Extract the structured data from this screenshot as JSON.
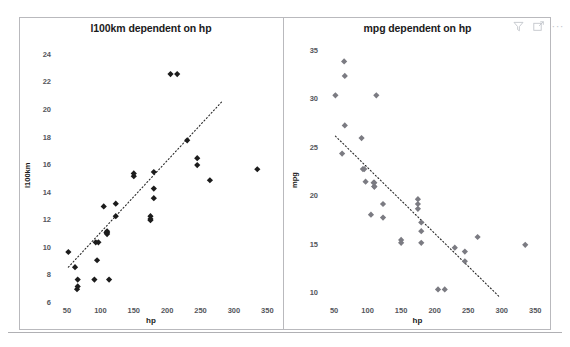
{
  "toolbar": {
    "icons": [
      {
        "name": "filter-icon",
        "label": "Filter"
      },
      {
        "name": "focus-mode-icon",
        "label": "Focus mode"
      },
      {
        "name": "more-options-icon",
        "label": "More options"
      }
    ],
    "more_glyph": "···"
  },
  "colors": {
    "panel_border": "#b9b9bd",
    "title_text": "#1b1b1b",
    "tick_text": "#54565c",
    "left_marker": "#1c1c1c",
    "right_marker": "#7b7b82",
    "trend_line": "#2a2a2a",
    "background": "#ffffff"
  },
  "chart_data": [
    {
      "id": "l100km-vs-hp",
      "type": "scatter",
      "title": "l100km dependent on hp",
      "xlabel": "hp",
      "ylabel": "l100km",
      "xlim": [
        35,
        360
      ],
      "ylim": [
        6,
        25
      ],
      "xticks": [
        50,
        100,
        150,
        200,
        250,
        300,
        350
      ],
      "yticks": [
        6,
        8,
        10,
        12,
        14,
        16,
        18,
        20,
        22,
        24
      ],
      "grid": false,
      "legend": "none",
      "marker": "diamond",
      "trendline": {
        "type": "linear-dotted",
        "x": [
          52,
          282
        ],
        "y": [
          8.6,
          20.6
        ]
      },
      "points": [
        [
          110,
          11.0
        ],
        [
          110,
          11.1
        ],
        [
          93,
          10.4
        ],
        [
          110,
          11.2
        ],
        [
          175,
          12.3
        ],
        [
          105,
          13.0
        ],
        [
          245,
          16.5
        ],
        [
          62,
          8.6
        ],
        [
          95,
          9.1
        ],
        [
          123,
          12.3
        ],
        [
          123,
          13.2
        ],
        [
          180,
          14.3
        ],
        [
          180,
          15.5
        ],
        [
          180,
          13.6
        ],
        [
          205,
          22.6
        ],
        [
          215,
          22.6
        ],
        [
          230,
          17.8
        ],
        [
          66,
          7.7
        ],
        [
          52,
          9.7
        ],
        [
          65,
          7.0
        ],
        [
          97,
          10.4
        ],
        [
          150,
          15.2
        ],
        [
          150,
          15.4
        ],
        [
          245,
          16.0
        ],
        [
          175,
          12.1
        ],
        [
          66,
          7.2
        ],
        [
          91,
          7.7
        ],
        [
          113,
          7.7
        ],
        [
          264,
          14.9
        ],
        [
          175,
          12.0
        ],
        [
          335,
          15.7
        ],
        [
          109,
          11.1
        ]
      ]
    },
    {
      "id": "mpg-vs-hp",
      "type": "scatter",
      "title": "mpg dependent on hp",
      "xlabel": "hp",
      "ylabel": "mpg",
      "xlim": [
        35,
        360
      ],
      "ylim": [
        9,
        36
      ],
      "xticks": [
        50,
        100,
        150,
        200,
        250,
        300,
        350
      ],
      "yticks": [
        10,
        15,
        20,
        25,
        30,
        35
      ],
      "grid": false,
      "legend": "none",
      "marker": "diamond",
      "trendline": {
        "type": "linear-dotted",
        "x": [
          52,
          297
        ],
        "y": [
          26.2,
          9.6
        ]
      },
      "points": [
        [
          110,
          21.0
        ],
        [
          110,
          21.0
        ],
        [
          93,
          22.8
        ],
        [
          110,
          21.4
        ],
        [
          175,
          18.7
        ],
        [
          105,
          18.1
        ],
        [
          245,
          14.3
        ],
        [
          62,
          24.4
        ],
        [
          95,
          22.8
        ],
        [
          123,
          19.2
        ],
        [
          123,
          17.8
        ],
        [
          180,
          16.4
        ],
        [
          180,
          17.3
        ],
        [
          180,
          15.2
        ],
        [
          205,
          10.4
        ],
        [
          215,
          10.4
        ],
        [
          230,
          14.7
        ],
        [
          66,
          32.4
        ],
        [
          52,
          30.4
        ],
        [
          65,
          33.9
        ],
        [
          97,
          21.5
        ],
        [
          150,
          15.5
        ],
        [
          150,
          15.2
        ],
        [
          245,
          13.3
        ],
        [
          175,
          19.2
        ],
        [
          66,
          27.3
        ],
        [
          91,
          26.0
        ],
        [
          113,
          30.4
        ],
        [
          264,
          15.8
        ],
        [
          175,
          19.7
        ],
        [
          335,
          15.0
        ],
        [
          109,
          21.4
        ]
      ]
    }
  ]
}
